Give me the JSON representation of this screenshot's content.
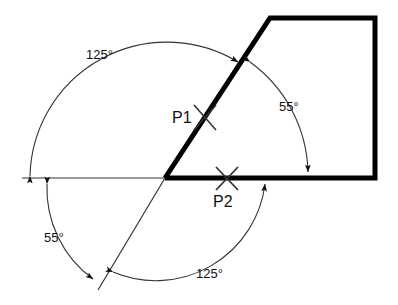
{
  "diagram": {
    "background_color": "#ffffff",
    "line_color": "#111111",
    "thick_line_color": "#000000",
    "points": [
      {
        "id": "P1",
        "label": "P1",
        "label_x": 172,
        "label_y": 123,
        "mark_x": 206,
        "mark_y": 117
      },
      {
        "id": "P2",
        "label": "P2",
        "label_x": 213,
        "label_y": 207,
        "mark_x": 227,
        "mark_y": 178
      }
    ],
    "angle_labels": [
      {
        "id": "upper-left",
        "text": "125°",
        "x": 86,
        "y": 59
      },
      {
        "id": "right",
        "text": "55°",
        "x": 279,
        "y": 111
      },
      {
        "id": "lower-left",
        "text": "55°",
        "x": 44,
        "y": 242
      },
      {
        "id": "lower-right",
        "text": "125°",
        "x": 196,
        "y": 278
      }
    ],
    "geometry": {
      "vertex_x": 165,
      "vertex_y": 178,
      "reference_line_left_x": 22,
      "reference_line_y": 178,
      "diagonal_lower_x": 98,
      "diagonal_lower_y": 290,
      "shape_top_left_x": 270,
      "shape_top_left_y": 18,
      "shape_top_right_x": 375,
      "shape_top_right_y": 18,
      "shape_bottom_right_x": 375,
      "shape_bottom_right_y": 178
    }
  }
}
